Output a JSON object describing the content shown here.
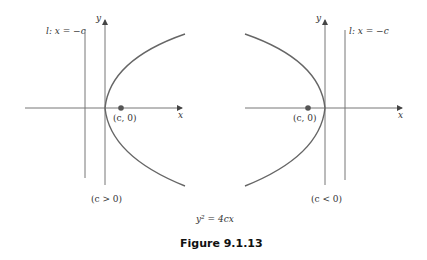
{
  "left": {
    "directrix_label": "l: x = −c",
    "y_axis_label": "y",
    "x_axis_label": "x",
    "focus_label": "(c, 0)",
    "condition_label": "(c > 0)"
  },
  "right": {
    "directrix_label": "l: x = −c",
    "y_axis_label": "y",
    "x_axis_label": "x",
    "focus_label": "(c, 0)",
    "condition_label": "(c < 0)"
  },
  "equation": "y² = 4cx",
  "caption": "Figure 9.1.13",
  "colors": {
    "curve": "#555555",
    "axis": "#666666",
    "focus": "#555555"
  }
}
